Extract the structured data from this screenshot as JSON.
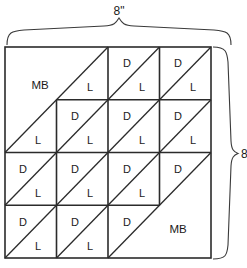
{
  "figure": {
    "top_dimension": "8\"",
    "right_dimension": "8\"",
    "unit": "inches",
    "grid": {
      "rows": 4,
      "cols": 4
    },
    "colors": {
      "line": "#2b2b2b",
      "brace": "#3a3a3a",
      "text": "#1a1a1a",
      "patch_fill": "#ffffff"
    }
  },
  "legend_codes": {
    "MB": "MB",
    "D": "D",
    "L": "L"
  },
  "blocks": [
    {
      "name": "top-left-mb-block",
      "span": "2x2",
      "label": "MB",
      "diagonal": "bottomleft-to-topright",
      "label_side": "upper-left"
    },
    {
      "name": "bottom-right-mb-block",
      "span": "2x2",
      "label": "MB",
      "diagonal": "bottomleft-to-topright",
      "label_side": "lower-right"
    }
  ],
  "cells": [
    {
      "row": 1,
      "col": 1,
      "type": "mb-block",
      "labels": []
    },
    {
      "row": 1,
      "col": 2,
      "type": "half-square",
      "labels": [
        "L"
      ]
    },
    {
      "row": 1,
      "col": 3,
      "type": "half-square",
      "labels": [
        "D",
        "L"
      ]
    },
    {
      "row": 1,
      "col": 4,
      "type": "half-square",
      "labels": [
        "D",
        "L"
      ]
    },
    {
      "row": 2,
      "col": 1,
      "type": "mb-block",
      "labels": [
        "L"
      ]
    },
    {
      "row": 2,
      "col": 2,
      "type": "half-square",
      "labels": [
        "D",
        "L"
      ]
    },
    {
      "row": 2,
      "col": 3,
      "type": "half-square",
      "labels": [
        "D",
        "L"
      ]
    },
    {
      "row": 2,
      "col": 4,
      "type": "half-square",
      "labels": [
        "D",
        "L"
      ]
    },
    {
      "row": 3,
      "col": 1,
      "type": "half-square",
      "labels": [
        "D",
        "L"
      ]
    },
    {
      "row": 3,
      "col": 2,
      "type": "half-square",
      "labels": [
        "D",
        "L"
      ]
    },
    {
      "row": 3,
      "col": 3,
      "type": "half-square",
      "labels": [
        "D",
        "L"
      ]
    },
    {
      "row": 3,
      "col": 4,
      "type": "mb-block",
      "labels": [
        "D"
      ]
    },
    {
      "row": 4,
      "col": 1,
      "type": "half-square",
      "labels": [
        "D",
        "L"
      ]
    },
    {
      "row": 4,
      "col": 2,
      "type": "half-square",
      "labels": [
        "D",
        "L"
      ]
    },
    {
      "row": 4,
      "col": 3,
      "type": "half-square",
      "labels": [
        "D"
      ]
    },
    {
      "row": 4,
      "col": 4,
      "type": "mb-block",
      "labels": []
    }
  ],
  "patch_labels": {
    "r1c1_mb": "MB",
    "r1c2_l": "L",
    "r1c3_d": "D",
    "r1c3_l": "L",
    "r1c4_d": "D",
    "r1c4_l": "L",
    "r2c1_l": "L",
    "r2c2_d": "D",
    "r2c2_l": "L",
    "r2c3_d": "D",
    "r2c3_l": "L",
    "r2c4_d": "D",
    "r2c4_l": "L",
    "r3c1_d": "D",
    "r3c1_l": "L",
    "r3c2_d": "D",
    "r3c2_l": "L",
    "r3c3_d": "D",
    "r3c3_l": "L",
    "r3c4_d": "D",
    "r4c1_d": "D",
    "r4c1_l": "L",
    "r4c2_d": "D",
    "r4c2_l": "L",
    "r4c3_d": "D",
    "r4c4_mb": "MB"
  }
}
